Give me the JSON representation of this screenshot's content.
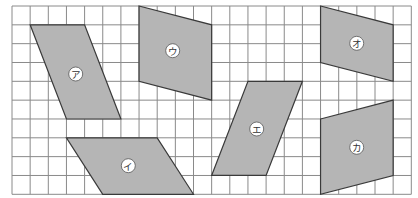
{
  "figure": {
    "grid": {
      "origin_x": 12,
      "origin_y": 6,
      "cols": 22,
      "rows": 10,
      "cell_w": 18.15,
      "cell_h": 18.83,
      "line_color": "#8a8a8a"
    },
    "fill_color": "#b5b5b5",
    "outline_color": "#3a3a3a",
    "shapes": [
      {
        "id": "a",
        "label": "ア",
        "points": [
          [
            1,
            1
          ],
          [
            4,
            1
          ],
          [
            6,
            6
          ],
          [
            3,
            6
          ]
        ],
        "label_pos": [
          75.7,
          74
        ]
      },
      {
        "id": "i",
        "label": "イ",
        "points": [
          [
            3,
            7
          ],
          [
            8,
            7
          ],
          [
            10,
            10
          ],
          [
            5,
            10
          ]
        ],
        "label_pos": [
          128.3,
          165.7
        ]
      },
      {
        "id": "u",
        "label": "ウ",
        "points": [
          [
            7,
            0
          ],
          [
            11,
            1
          ],
          [
            11,
            5
          ],
          [
            7,
            4
          ]
        ],
        "label_pos": [
          172.7,
          50.7
        ]
      },
      {
        "id": "e",
        "label": "エ",
        "points": [
          [
            13,
            4
          ],
          [
            16,
            4
          ],
          [
            14,
            9
          ],
          [
            11,
            9
          ]
        ],
        "label_pos": [
          256.7,
          129
        ]
      },
      {
        "id": "o",
        "label": "オ",
        "points": [
          [
            17,
            0
          ],
          [
            21,
            1
          ],
          [
            21,
            4
          ],
          [
            17,
            3
          ]
        ],
        "label_pos": [
          356.7,
          43.3
        ]
      },
      {
        "id": "ka",
        "label": "カ",
        "points": [
          [
            17,
            6
          ],
          [
            21,
            5
          ],
          [
            21,
            9
          ],
          [
            17,
            10
          ]
        ],
        "label_pos": [
          356.7,
          147.3
        ]
      }
    ]
  }
}
